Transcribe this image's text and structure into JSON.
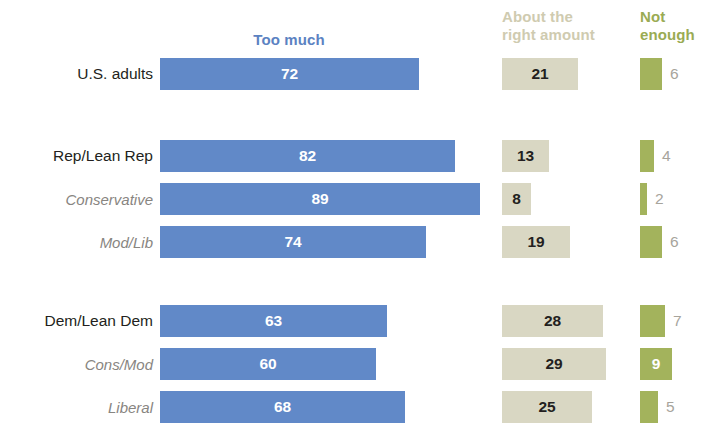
{
  "chart_data": {
    "type": "bar",
    "orientation": "horizontal",
    "stacked": false,
    "title": "",
    "subtitle": "",
    "xlabel": "",
    "ylabel": "",
    "xlim": [
      0,
      100
    ],
    "grid": false,
    "legend_position": "top",
    "columns": [
      {
        "key": "too_much",
        "label": "Too much",
        "color": "#6189c8",
        "header_color": "#5b82c2"
      },
      {
        "key": "right_amount",
        "label": "About the\nright amount",
        "color": "#d9d7c3",
        "header_color": "#cfcbb0"
      },
      {
        "key": "not_enough",
        "label": "Not\nenough",
        "color": "#a3b35c",
        "header_color": "#9aab53"
      }
    ],
    "categories": [
      "U.S. adults",
      "Rep/Lean Rep",
      "Conservative",
      "Mod/Lib",
      "Dem/Lean Dem",
      "Cons/Mod",
      "Liberal"
    ],
    "series": [
      {
        "name": "Too much",
        "values": [
          72,
          82,
          89,
          74,
          63,
          60,
          68
        ]
      },
      {
        "name": "About the right amount",
        "values": [
          21,
          13,
          8,
          19,
          28,
          29,
          25
        ]
      },
      {
        "name": "Not enough",
        "values": [
          6,
          4,
          2,
          6,
          7,
          9,
          5
        ]
      }
    ]
  },
  "legend": {
    "too_much": "Too much",
    "right_amount_line1": "About the",
    "right_amount_line2": "right amount",
    "not_enough_line1": "Not",
    "not_enough_line2": "enough"
  },
  "rows": [
    {
      "label": "U.S. adults",
      "style": "main",
      "too_much": "72",
      "right_amount": "21",
      "not_enough": "6"
    },
    {
      "label": "Rep/Lean Rep",
      "style": "main",
      "too_much": "82",
      "right_amount": "13",
      "not_enough": "4"
    },
    {
      "label": "Conservative",
      "style": "sub",
      "too_much": "89",
      "right_amount": "8",
      "not_enough": "2"
    },
    {
      "label": "Mod/Lib",
      "style": "sub",
      "too_much": "74",
      "right_amount": "19",
      "not_enough": "6"
    },
    {
      "label": "Dem/Lean Dem",
      "style": "main",
      "too_much": "63",
      "right_amount": "28",
      "not_enough": "7"
    },
    {
      "label": "Cons/Mod",
      "style": "sub",
      "too_much": "60",
      "right_amount": "29",
      "not_enough": "9"
    },
    {
      "label": "Liberal",
      "style": "sub",
      "too_much": "68",
      "right_amount": "25",
      "not_enough": "5"
    }
  ],
  "layout": {
    "row_tops": [
      58,
      140,
      183,
      226,
      305,
      348,
      391
    ],
    "bar_height": 32,
    "px_per_unit": 3.6,
    "col_x": {
      "too_much": 160,
      "right_amount": 502,
      "not_enough": 640
    }
  }
}
